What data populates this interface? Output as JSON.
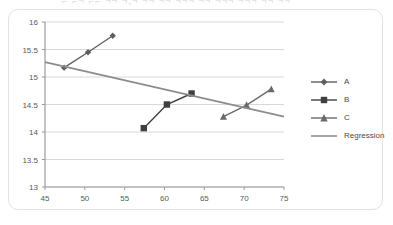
{
  "header": {
    "cropped_caption": "⌐ ⌐¬ ⌐⌐  ¬¬ ¬,¬ ¬¬  ¬¬ ¬¬¬ ¬¬ ¬¬¬ ¬¬¬ ¬¬ ¬¬"
  },
  "legend": {
    "position": "right",
    "items": [
      {
        "label": "A",
        "marker": "diamond-marker",
        "color": "#5f5f5f"
      },
      {
        "label": "B",
        "marker": "square-marker",
        "color": "#3f3f3f"
      },
      {
        "label": "C",
        "marker": "triangle-marker",
        "color": "#6a6a6a"
      },
      {
        "label": "Regression",
        "marker": "line-marker",
        "color": "#8c8c8c"
      }
    ]
  },
  "chart_data": {
    "type": "scatter",
    "title": "",
    "xlabel": "",
    "ylabel": "",
    "xlim": [
      45,
      75
    ],
    "ylim": [
      13,
      16
    ],
    "xticks": [
      45,
      50,
      55,
      60,
      65,
      70,
      75
    ],
    "yticks": [
      13,
      13.5,
      14,
      14.5,
      15,
      15.5,
      16
    ],
    "xtick_labels": [
      "45",
      "50",
      "55",
      "60",
      "65",
      "70",
      "75"
    ],
    "ytick_labels": [
      "13",
      "13.5",
      "14",
      "14.5",
      "15",
      "15.5",
      "16"
    ],
    "grid": "horizontal",
    "legend_position": "right",
    "series": [
      {
        "name": "A",
        "marker": "diamond",
        "color": "#5f5f5f",
        "x": [
          47.4,
          50.4,
          53.5
        ],
        "y": [
          15.17,
          15.45,
          15.75
        ]
      },
      {
        "name": "B",
        "marker": "square",
        "color": "#3f3f3f",
        "x": [
          57.4,
          60.3,
          63.4
        ],
        "y": [
          14.07,
          14.5,
          14.7
        ]
      },
      {
        "name": "C",
        "marker": "triangle",
        "color": "#6a6a6a",
        "x": [
          67.4,
          70.3,
          73.4
        ],
        "y": [
          14.28,
          14.49,
          14.78
        ]
      },
      {
        "name": "Regression",
        "marker": "none",
        "color": "#8c8c8c",
        "x": [
          45,
          75
        ],
        "y": [
          15.27,
          14.28
        ]
      }
    ]
  }
}
